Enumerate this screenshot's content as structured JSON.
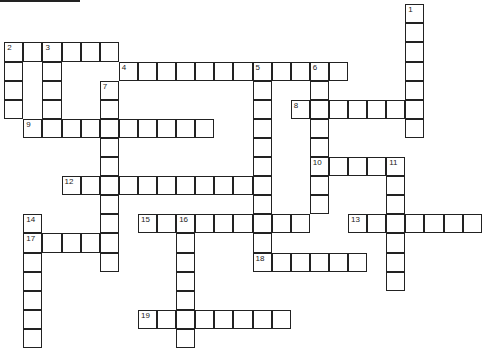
{
  "puzzle": {
    "type": "crossword",
    "cell_size": 19.1,
    "origin": [
      5,
      5
    ],
    "entries": [
      {
        "number": 1,
        "direction": "down",
        "row": 0,
        "col": 21,
        "length": 7
      },
      {
        "number": 2,
        "direction": "across",
        "row": 2,
        "col": 0,
        "length": 6
      },
      {
        "number": 2,
        "direction": "down",
        "row": 2,
        "col": 0,
        "length": 4
      },
      {
        "number": 3,
        "direction": "down",
        "row": 2,
        "col": 2,
        "length": 4
      },
      {
        "number": 4,
        "direction": "across",
        "row": 3,
        "col": 6,
        "length": 12
      },
      {
        "number": 5,
        "direction": "down",
        "row": 3,
        "col": 13,
        "length": 11
      },
      {
        "number": 6,
        "direction": "down",
        "row": 3,
        "col": 16,
        "length": 8
      },
      {
        "number": 7,
        "direction": "down",
        "row": 4,
        "col": 5,
        "length": 10
      },
      {
        "number": 8,
        "direction": "across",
        "row": 5,
        "col": 15,
        "length": 7
      },
      {
        "number": 9,
        "direction": "across",
        "row": 6,
        "col": 1,
        "length": 10
      },
      {
        "number": 10,
        "direction": "across",
        "row": 8,
        "col": 16,
        "length": 5
      },
      {
        "number": 11,
        "direction": "down",
        "row": 8,
        "col": 20,
        "length": 7
      },
      {
        "number": 12,
        "direction": "across",
        "row": 9,
        "col": 3,
        "length": 11
      },
      {
        "number": 13,
        "direction": "across",
        "row": 11,
        "col": 18,
        "length": 7
      },
      {
        "number": 14,
        "direction": "down",
        "row": 11,
        "col": 1,
        "length": 7
      },
      {
        "number": 15,
        "direction": "across",
        "row": 11,
        "col": 7,
        "length": 9
      },
      {
        "number": 16,
        "direction": "down",
        "row": 11,
        "col": 9,
        "length": 7
      },
      {
        "number": 17,
        "direction": "across",
        "row": 12,
        "col": 1,
        "length": 5
      },
      {
        "number": 18,
        "direction": "across",
        "row": 13,
        "col": 13,
        "length": 6
      },
      {
        "number": 19,
        "direction": "across",
        "row": 16,
        "col": 7,
        "length": 8
      }
    ]
  }
}
